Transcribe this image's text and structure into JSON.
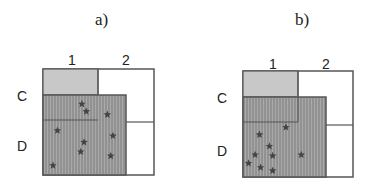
{
  "panels": [
    {
      "id": "a",
      "title": "a)",
      "columns": [
        "1",
        "2"
      ],
      "rows": [
        "C",
        "D"
      ],
      "cells": {
        "C1": "gray-shaded",
        "C2": "white",
        "D2": "white"
      },
      "hatched_region": "covers C1 lower portion and most of D, excludes column 2 right edge",
      "star_count": 9,
      "stars": [
        {
          "region": "C1-lower",
          "cx": 0.35,
          "cy": 0.33
        },
        {
          "region": "C1-lower",
          "cx": 0.39,
          "cy": 0.4
        },
        {
          "region": "D",
          "cx": 0.58,
          "cy": 0.43
        },
        {
          "region": "D",
          "cx": 0.13,
          "cy": 0.58
        },
        {
          "region": "D",
          "cx": 0.37,
          "cy": 0.69
        },
        {
          "region": "D",
          "cx": 0.34,
          "cy": 0.78
        },
        {
          "region": "D",
          "cx": 0.63,
          "cy": 0.63
        },
        {
          "region": "D",
          "cx": 0.61,
          "cy": 0.82
        },
        {
          "region": "D",
          "cx": 0.09,
          "cy": 0.91
        }
      ]
    },
    {
      "id": "b",
      "title": "b)",
      "columns": [
        "1",
        "2"
      ],
      "rows": [
        "C",
        "D"
      ],
      "cells": {
        "C1": "gray-shaded",
        "C2": "white",
        "D2": "white"
      },
      "hatched_region": "covers C1 lower portion and most of D, excludes column 2 right edge",
      "star_count": 9,
      "stars": [
        {
          "region": "D",
          "cx": 0.39,
          "cy": 0.53
        },
        {
          "region": "D",
          "cx": 0.15,
          "cy": 0.6
        },
        {
          "region": "D",
          "cx": 0.24,
          "cy": 0.71
        },
        {
          "region": "D",
          "cx": 0.11,
          "cy": 0.79
        },
        {
          "region": "D",
          "cx": 0.27,
          "cy": 0.8
        },
        {
          "region": "D",
          "cx": 0.53,
          "cy": 0.79
        },
        {
          "region": "D",
          "cx": 0.05,
          "cy": 0.87
        },
        {
          "region": "D",
          "cx": 0.16,
          "cy": 0.91
        },
        {
          "region": "D",
          "cx": 0.27,
          "cy": 0.94
        }
      ]
    }
  ],
  "colors": {
    "outline": "#555555",
    "gray_fill": "#c8c8c8",
    "hatch_bg": "#a9a9a9",
    "hatch_line": "#7a7a7a",
    "star": "#444444"
  }
}
